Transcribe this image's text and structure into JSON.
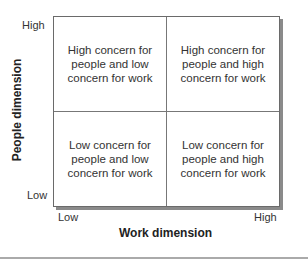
{
  "diagram": {
    "type": "2x2 matrix",
    "y_axis": {
      "label": "People dimension",
      "high": "High",
      "low": "Low"
    },
    "x_axis": {
      "label": "Work dimension",
      "low": "Low",
      "high": "High"
    },
    "quadrants": {
      "top_left": "High concern for people and low concern for work",
      "top_right": "High concern for people and high concern for work",
      "bottom_left": "Low concern for people and low concern for work",
      "bottom_right": "Low concern for people and high concern for work"
    }
  }
}
